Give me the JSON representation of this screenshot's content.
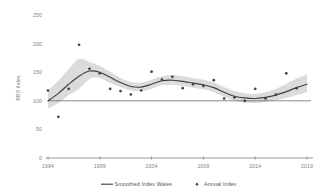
{
  "chart_data": {
    "type": "line",
    "title": "",
    "xlabel": "",
    "ylabel": "BBS Index",
    "xlim": [
      1994,
      2019
    ],
    "ylim": [
      0,
      250
    ],
    "grid": false,
    "legend_position": "bottom",
    "y_ticks": [
      "0",
      "50",
      "100",
      "150",
      "200",
      "250"
    ],
    "y_tick_values": [
      0,
      50,
      100,
      150,
      200,
      250
    ],
    "x_ticks": [
      "1994",
      "1999",
      "2004",
      "2009",
      "2014",
      "2019"
    ],
    "x_tick_values": [
      1994,
      1999,
      2004,
      2009,
      2014,
      2019
    ],
    "reference_line": 100,
    "x": [
      1994,
      1995,
      1996,
      1997,
      1998,
      1999,
      2000,
      2001,
      2002,
      2003,
      2004,
      2005,
      2006,
      2007,
      2008,
      2009,
      2010,
      2011,
      2012,
      2013,
      2014,
      2015,
      2016,
      2017,
      2018,
      2019
    ],
    "series": [
      {
        "name": "Annual Index",
        "type": "scatter",
        "values": [
          118,
          72,
          121,
          198,
          156,
          148,
          121,
          117,
          111,
          118,
          151,
          137,
          142,
          122,
          129,
          126,
          136,
          104,
          106,
          100,
          121,
          104,
          111,
          148,
          122,
          null
        ]
      },
      {
        "name": "Smoothed Index Wales",
        "type": "line",
        "values": [
          100,
          113,
          129,
          143,
          152,
          150,
          141,
          132,
          125,
          124,
          129,
          135,
          136,
          134,
          131,
          128,
          123,
          115,
          108,
          105,
          104,
          106,
          110,
          116,
          123,
          129
        ]
      },
      {
        "name": "Confidence band upper",
        "type": "band_upper",
        "values": [
          118,
          135,
          155,
          173,
          168,
          161,
          151,
          140,
          133,
          132,
          137,
          143,
          145,
          143,
          140,
          137,
          132,
          124,
          117,
          113,
          112,
          115,
          121,
          130,
          139,
          146
        ]
      },
      {
        "name": "Confidence band lower",
        "type": "band_lower",
        "values": [
          86,
          96,
          110,
          121,
          138,
          140,
          131,
          124,
          118,
          117,
          121,
          127,
          128,
          126,
          123,
          120,
          115,
          107,
          100,
          97,
          96,
          98,
          101,
          105,
          110,
          115
        ]
      }
    ]
  },
  "legend": {
    "items": [
      {
        "label": "Smoothed Index Wales",
        "marker": "line",
        "color": "#404040"
      },
      {
        "label": "Annual Index",
        "marker": "dot",
        "color": "#404040"
      }
    ]
  },
  "colors": {
    "line": "#404040",
    "band": "#d9d9d9",
    "axis": "#808080",
    "text": "#7f7f7f",
    "background": "#ffffff"
  }
}
